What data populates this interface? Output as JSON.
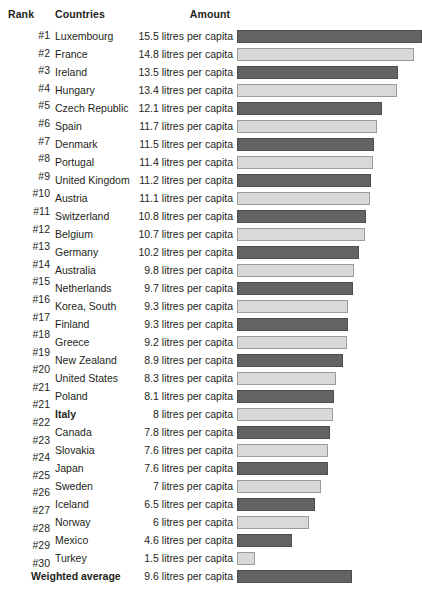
{
  "header": {
    "rank_label": "Rank",
    "countries_label": "Countries",
    "amount_label": "Amount"
  },
  "colors": {
    "bar_dark": "#636363",
    "bar_light": "#d9d9d9",
    "text": "#231f20",
    "background": "#ffffff"
  },
  "chart_data": {
    "type": "bar",
    "title": "",
    "xlabel": "",
    "ylabel": "",
    "unit": "litres per capita",
    "orientation": "horizontal",
    "grid": false,
    "legend": "none",
    "xlim": [
      0,
      15.5
    ],
    "categories": [
      "Luxembourg",
      "France",
      "Ireland",
      "Hungary",
      "Czech Republic",
      "Spain",
      "Denmark",
      "Portugal",
      "United Kingdom",
      "Austria",
      "Switzerland",
      "Belgium",
      "Germany",
      "Australia",
      "Netherlands",
      "Korea, South",
      "Finland",
      "Greece",
      "New Zealand",
      "United States",
      "Poland",
      "Italy",
      "Canada",
      "Slovakia",
      "Japan",
      "Sweden",
      "Iceland",
      "Norway",
      "Mexico",
      "Turkey"
    ],
    "values": [
      15.5,
      14.8,
      13.5,
      13.4,
      12.1,
      11.7,
      11.5,
      11.4,
      11.2,
      11.1,
      10.8,
      10.7,
      10.2,
      9.8,
      9.7,
      9.3,
      9.3,
      9.2,
      8.9,
      8.3,
      8.1,
      8,
      7.8,
      7.6,
      7.6,
      7,
      6.5,
      6,
      4.6,
      1.5
    ],
    "summary": {
      "label": "Weighted average",
      "value": 9.6
    }
  },
  "ranks": [
    "#1",
    "#2",
    "#3",
    "#4",
    "#5",
    "#6",
    "#7",
    "#8",
    "#9",
    "#10",
    "#11",
    "#12",
    "#13",
    "#14",
    "#15",
    "#16",
    "#17",
    "#18",
    "#19",
    "#20",
    "#21",
    "#21",
    "#22",
    "#23",
    "#24",
    "#25",
    "#26",
    "#27",
    "#28",
    "#29",
    "#30",
    ""
  ],
  "rows": [
    {
      "rank": "#1",
      "country": "Luxembourg",
      "amount": "15.5 litres per capita",
      "value": 15.5,
      "shade": "dark",
      "bold": false
    },
    {
      "rank": "#2",
      "country": "France",
      "amount": "14.8 litres per capita",
      "value": 14.8,
      "shade": "light",
      "bold": false
    },
    {
      "rank": "#3",
      "country": "Ireland",
      "amount": "13.5 litres per capita",
      "value": 13.5,
      "shade": "dark",
      "bold": false
    },
    {
      "rank": "#4",
      "country": "Hungary",
      "amount": "13.4 litres per capita",
      "value": 13.4,
      "shade": "light",
      "bold": false
    },
    {
      "rank": "#5",
      "country": "Czech Republic",
      "amount": "12.1 litres per capita",
      "value": 12.1,
      "shade": "dark",
      "bold": false
    },
    {
      "rank": "#6",
      "country": "Spain",
      "amount": "11.7 litres per capita",
      "value": 11.7,
      "shade": "light",
      "bold": false
    },
    {
      "rank": "#7",
      "country": "Denmark",
      "amount": "11.5 litres per capita",
      "value": 11.5,
      "shade": "dark",
      "bold": false
    },
    {
      "rank": "#8",
      "country": "Portugal",
      "amount": "11.4 litres per capita",
      "value": 11.4,
      "shade": "light",
      "bold": false
    },
    {
      "rank": "#9",
      "country": "United Kingdom",
      "amount": "11.2 litres per capita",
      "value": 11.2,
      "shade": "dark",
      "bold": false
    },
    {
      "rank": "#10",
      "country": "Austria",
      "amount": "11.1 litres per capita",
      "value": 11.1,
      "shade": "light",
      "bold": false
    },
    {
      "rank": "#11",
      "country": "Switzerland",
      "amount": "10.8 litres per capita",
      "value": 10.8,
      "shade": "dark",
      "bold": false
    },
    {
      "rank": "#12",
      "country": "Belgium",
      "amount": "10.7 litres per capita",
      "value": 10.7,
      "shade": "light",
      "bold": false
    },
    {
      "rank": "#13",
      "country": "Germany",
      "amount": "10.2 litres per capita",
      "value": 10.2,
      "shade": "dark",
      "bold": false
    },
    {
      "rank": "#14",
      "country": "Australia",
      "amount": "9.8 litres per capita",
      "value": 9.8,
      "shade": "light",
      "bold": false
    },
    {
      "rank": "#15",
      "country": "Netherlands",
      "amount": "9.7 litres per capita",
      "value": 9.7,
      "shade": "dark",
      "bold": false
    },
    {
      "rank": "#16",
      "country": "Korea, South",
      "amount": "9.3 litres per capita",
      "value": 9.3,
      "shade": "light",
      "bold": false
    },
    {
      "rank": "#17",
      "country": "Finland",
      "amount": "9.3 litres per capita",
      "value": 9.3,
      "shade": "dark",
      "bold": false
    },
    {
      "rank": "#18",
      "country": "Greece",
      "amount": "9.2 litres per capita",
      "value": 9.2,
      "shade": "light",
      "bold": false
    },
    {
      "rank": "#19",
      "country": "New Zealand",
      "amount": "8.9 litres per capita",
      "value": 8.9,
      "shade": "dark",
      "bold": false
    },
    {
      "rank": "#20",
      "country": "United States",
      "amount": "8.3 litres per capita",
      "value": 8.3,
      "shade": "light",
      "bold": false
    },
    {
      "rank": "#21",
      "country": "Poland",
      "amount": "8.1 litres per capita",
      "value": 8.1,
      "shade": "dark",
      "bold": false
    },
    {
      "rank": "#21",
      "country": "Italy",
      "amount": "8 litres per capita",
      "value": 8,
      "shade": "light",
      "bold": true
    },
    {
      "rank": "#22",
      "country": "Canada",
      "amount": "7.8 litres per capita",
      "value": 7.8,
      "shade": "dark",
      "bold": false
    },
    {
      "rank": "#23",
      "country": "Slovakia",
      "amount": "7.6 litres per capita",
      "value": 7.6,
      "shade": "light",
      "bold": false
    },
    {
      "rank": "#24",
      "country": "Japan",
      "amount": "7.6 litres per capita",
      "value": 7.6,
      "shade": "dark",
      "bold": false
    },
    {
      "rank": "#25",
      "country": "Sweden",
      "amount": "7 litres per capita",
      "value": 7,
      "shade": "light",
      "bold": false
    },
    {
      "rank": "#26",
      "country": "Iceland",
      "amount": "6.5 litres per capita",
      "value": 6.5,
      "shade": "dark",
      "bold": false
    },
    {
      "rank": "#27",
      "country": "Norway",
      "amount": "6 litres per capita",
      "value": 6,
      "shade": "light",
      "bold": false
    },
    {
      "rank": "#28",
      "country": "Mexico",
      "amount": "4.6 litres per capita",
      "value": 4.6,
      "shade": "dark",
      "bold": false
    },
    {
      "rank": "#29",
      "country": "Turkey",
      "amount": "1.5 litres per capita",
      "value": 1.5,
      "shade": "light",
      "bold": false
    },
    {
      "rank": "#30",
      "country": "Weighted average",
      "amount": "9.6 litres per capita",
      "value": 9.6,
      "shade": "dark",
      "bold": true,
      "summary": true
    }
  ],
  "scale": {
    "px_per_unit": 11.95,
    "bar_left": 237
  }
}
